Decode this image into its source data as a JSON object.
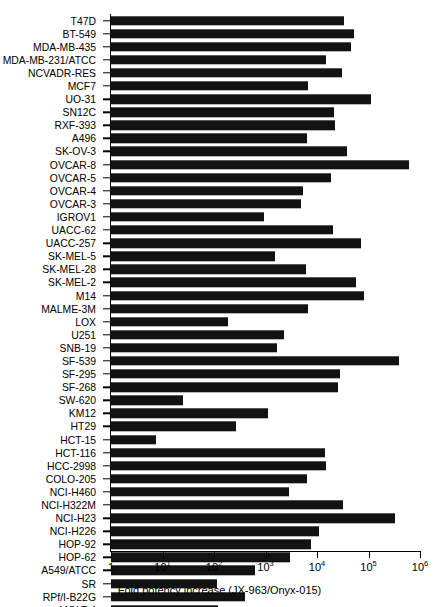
{
  "top_clipped_text": "",
  "chart_data": {
    "type": "bar",
    "orientation": "horizontal",
    "title": "",
    "xlabel": "Fold potency increase (JX-963/Onyx-015)",
    "ylabel": "",
    "xscale": "log",
    "xlim": [
      1,
      1000000
    ],
    "grid": false,
    "legend": null,
    "xticks": [
      1,
      10,
      100,
      1000,
      10000,
      100000,
      1000000
    ],
    "xticklabels": [
      "1",
      "10¹",
      "10²",
      "10³",
      "10⁴",
      "10⁵",
      "10⁶"
    ],
    "categories": [
      "T47D",
      "BT-549",
      "MDA-MB-435",
      "MDA-MB-231/ATCC",
      "NCVADR-RES",
      "MCF7",
      "UO-31",
      "SN12C",
      "RXF-393",
      "A496",
      "SK-OV-3",
      "OVCAR-8",
      "OVCAR-5",
      "OVCAR-4",
      "OVCAR-3",
      "IGROV1",
      "UACC-62",
      "UACC-257",
      "SK-MEL-5",
      "SK-MEL-28",
      "SK-MEL-2",
      "M14",
      "MALME-3M",
      "LOX",
      "U251",
      "SNB-19",
      "SF-539",
      "SF-295",
      "SF-268",
      "SW-620",
      "KM12",
      "HT29",
      "HCT-15",
      "HCT-116",
      "HCC-2998",
      "COLO-205",
      "NCI-H460",
      "NCI-H322M",
      "NCI-H23",
      "NCI-H226",
      "HOP-92",
      "HOP-62",
      "A549/ATCC",
      "SR",
      "RPf/I-B22G",
      "MOLT-4"
    ],
    "values": [
      33000,
      53000,
      45000,
      15000,
      30000,
      6800,
      110000,
      21000,
      22000,
      6500,
      38000,
      620000,
      19000,
      5300,
      5000,
      950,
      20000,
      73000,
      1500,
      6000,
      58000,
      80000,
      6800,
      190,
      2300,
      1700,
      390000,
      28000,
      26000,
      25,
      1100,
      270,
      7.5,
      14000,
      15000,
      6400,
      2800,
      32000,
      330000,
      11000,
      7800,
      3000,
      630,
      115,
      400,
      120
    ]
  }
}
